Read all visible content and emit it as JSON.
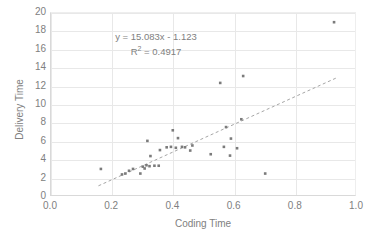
{
  "chart_data": {
    "type": "scatter",
    "title": "",
    "xlabel": "Coding Time",
    "ylabel": "Delivery Time",
    "xlim": [
      0.0,
      1.0
    ],
    "ylim": [
      0,
      20
    ],
    "xticks": [
      "0.0",
      "0.2",
      "0.4",
      "0.6",
      "0.8",
      "1.0"
    ],
    "xtick_values": [
      0.0,
      0.2,
      0.4,
      0.6,
      0.8,
      1.0
    ],
    "yticks": [
      "0",
      "2",
      "4",
      "6",
      "8",
      "10",
      "12",
      "14",
      "16",
      "18",
      "20"
    ],
    "ytick_values": [
      0,
      2,
      4,
      6,
      8,
      10,
      12,
      14,
      16,
      18,
      20
    ],
    "grid": true,
    "legend": false,
    "marker_color": "#7b7b7b",
    "trendline_color": "#a6a6a6",
    "gridline_color": "#e8e8e8",
    "axis_text_color": "#808080",
    "points": [
      [
        0.163,
        3.05
      ],
      [
        0.232,
        2.45
      ],
      [
        0.243,
        2.55
      ],
      [
        0.255,
        2.85
      ],
      [
        0.268,
        3.05
      ],
      [
        0.292,
        2.55
      ],
      [
        0.3,
        3.3
      ],
      [
        0.306,
        3.1
      ],
      [
        0.312,
        3.45
      ],
      [
        0.315,
        6.1
      ],
      [
        0.322,
        3.35
      ],
      [
        0.325,
        4.45
      ],
      [
        0.338,
        3.4
      ],
      [
        0.352,
        3.4
      ],
      [
        0.356,
        5.1
      ],
      [
        0.378,
        5.4
      ],
      [
        0.392,
        5.45
      ],
      [
        0.398,
        7.25
      ],
      [
        0.408,
        5.35
      ],
      [
        0.415,
        6.4
      ],
      [
        0.428,
        5.45
      ],
      [
        0.438,
        5.4
      ],
      [
        0.455,
        5.05
      ],
      [
        0.462,
        5.6
      ],
      [
        0.522,
        4.65
      ],
      [
        0.553,
        12.4
      ],
      [
        0.565,
        5.45
      ],
      [
        0.572,
        7.6
      ],
      [
        0.585,
        4.5
      ],
      [
        0.588,
        6.35
      ],
      [
        0.608,
        5.3
      ],
      [
        0.622,
        8.45
      ],
      [
        0.628,
        13.15
      ],
      [
        0.7,
        2.55
      ],
      [
        0.925,
        19.0
      ]
    ],
    "trendline": {
      "slope": 15.083,
      "intercept": -1.123,
      "x_start": 0.155,
      "x_end": 0.935,
      "style": "dashed"
    },
    "annotations": {
      "equation": "y = 15.083x - 1.123",
      "r_squared_prefix": "R",
      "r_squared_exponent": "2",
      "r_squared_value": " = 0.4917"
    }
  }
}
